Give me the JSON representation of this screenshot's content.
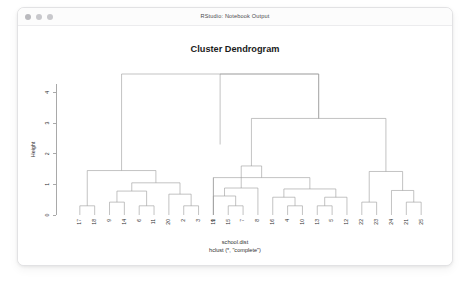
{
  "window": {
    "title": "RStudio: Notebook Output",
    "traffic_lights": [
      "close",
      "minimize",
      "zoom"
    ]
  },
  "chart_data": {
    "type": "dendrogram",
    "title": "Cluster Dendrogram",
    "ylabel": "Height",
    "xlabel": "school.dist",
    "caption": "hclust (*, \"complete\")",
    "method": "complete",
    "distance_object": "school.dist",
    "ylim": [
      0,
      4.6
    ],
    "yticks": [
      0,
      1,
      2,
      3,
      4
    ],
    "ytick_labels": [
      "0",
      "1",
      "2",
      "3",
      "4"
    ],
    "grid": false,
    "legend": null,
    "n_leaves": 24,
    "leaf_order": [
      "17",
      "18",
      "9",
      "14",
      "6",
      "11",
      "20",
      "2",
      "3",
      "19",
      "15",
      "7",
      "8",
      "16",
      "4",
      "10",
      "13",
      "5",
      "12",
      "22",
      "23",
      "24",
      "21",
      "25"
    ],
    "merges": [
      {
        "id": "m1",
        "left": "17",
        "right": "18",
        "height": 0.3
      },
      {
        "id": "m2",
        "left": "6",
        "right": "11",
        "height": 0.3
      },
      {
        "id": "m3",
        "left": "2",
        "right": "3",
        "height": 0.3
      },
      {
        "id": "m4",
        "left": "9",
        "right": "14",
        "height": 0.42
      },
      {
        "id": "m5",
        "left": "m4",
        "right": "m2",
        "height": 0.78
      },
      {
        "id": "m6",
        "left": "20",
        "right": "m3",
        "height": 0.68
      },
      {
        "id": "m7",
        "left": "m5",
        "right": "m6",
        "height": 1.05
      },
      {
        "id": "m8",
        "left": "m1",
        "right": "m7",
        "height": 1.45
      },
      {
        "id": "m9",
        "left": "m8",
        "right": "mid-root",
        "height": 2.3
      },
      {
        "id": "m10",
        "left": "15",
        "right": "7",
        "height": 0.3
      },
      {
        "id": "m11",
        "left": "19",
        "right": "m10",
        "height": 0.62
      },
      {
        "id": "m12",
        "left": "m11",
        "right": "8",
        "height": 0.88
      },
      {
        "id": "m13",
        "left": "4",
        "right": "10",
        "height": 0.3
      },
      {
        "id": "m14",
        "left": "13",
        "right": "5",
        "height": 0.3
      },
      {
        "id": "m15",
        "left": "16",
        "right": "m13",
        "height": 0.58
      },
      {
        "id": "m16",
        "left": "m14",
        "right": "12",
        "height": 0.58
      },
      {
        "id": "m17",
        "left": "m15",
        "right": "m16",
        "height": 0.85
      },
      {
        "id": "m18",
        "left": "1",
        "right": "m17",
        "height": 1.22
      },
      {
        "id": "m19",
        "left": "m12",
        "right": "m18",
        "height": 1.6
      },
      {
        "id": "m20",
        "left": "22",
        "right": "23",
        "height": 0.42
      },
      {
        "id": "m21",
        "left": "21",
        "right": "25",
        "height": 0.42
      },
      {
        "id": "m22",
        "left": "24",
        "right": "m21",
        "height": 0.8
      },
      {
        "id": "m23",
        "left": "m20",
        "right": "m22",
        "height": 1.42
      },
      {
        "id": "m24",
        "left": "m19",
        "right": "m23",
        "height": 3.15
      },
      {
        "id": "root",
        "left": "m9",
        "right": "m24",
        "height": 4.6
      }
    ]
  }
}
